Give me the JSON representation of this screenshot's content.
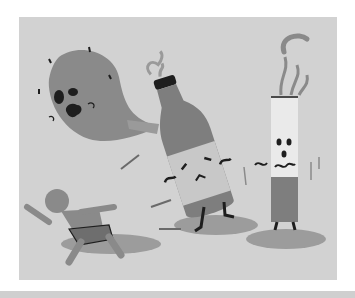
{
  "illustration": {
    "alt": "Cartoon of a frightened running child chased by a scared balloon-like organ, an angry bottle and a scared cigarette",
    "characters": [
      {
        "name": "running-child",
        "expression": "frightened"
      },
      {
        "name": "balloon-organ",
        "expression": "scared"
      },
      {
        "name": "bottle",
        "expression": "angry"
      },
      {
        "name": "cigarette",
        "expression": "scared"
      }
    ],
    "colors": {
      "background": "#d2d2d2",
      "character_fill": "#8a8a8a",
      "dark": "#1e1e1e",
      "light": "#eaeaea",
      "shadow": "#9c9c9c",
      "bottom_bar": "#cfcfcf"
    }
  }
}
